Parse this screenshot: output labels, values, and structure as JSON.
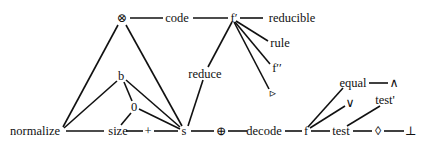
{
  "diagram": {
    "type": "graph",
    "nodes": [
      {
        "id": "otimes",
        "label": "⊗",
        "x": 122,
        "y": 18
      },
      {
        "id": "code",
        "label": "code",
        "x": 177,
        "y": 18
      },
      {
        "id": "fprime",
        "label": "f′",
        "x": 234,
        "y": 18
      },
      {
        "id": "reducible",
        "label": "reducible",
        "x": 292,
        "y": 18
      },
      {
        "id": "rule",
        "label": "rule",
        "x": 280,
        "y": 43
      },
      {
        "id": "fdouble",
        "label": "f′′",
        "x": 277,
        "y": 68
      },
      {
        "id": "triangle",
        "label": "▹",
        "x": 273,
        "y": 93
      },
      {
        "id": "reduce",
        "label": "reduce",
        "x": 205,
        "y": 74
      },
      {
        "id": "b",
        "label": "b",
        "x": 121,
        "y": 76
      },
      {
        "id": "zero",
        "label": "0",
        "x": 134,
        "y": 107
      },
      {
        "id": "normalize",
        "label": "normalize",
        "x": 35,
        "y": 131
      },
      {
        "id": "size",
        "label": "size",
        "x": 118,
        "y": 131
      },
      {
        "id": "plus",
        "label": "+",
        "x": 148,
        "y": 131
      },
      {
        "id": "s",
        "label": "s",
        "x": 184,
        "y": 131
      },
      {
        "id": "oplus",
        "label": "⊕",
        "x": 221,
        "y": 131
      },
      {
        "id": "decode",
        "label": "decode",
        "x": 264,
        "y": 131
      },
      {
        "id": "f",
        "label": "f",
        "x": 306,
        "y": 131
      },
      {
        "id": "test",
        "label": "test",
        "x": 341,
        "y": 131
      },
      {
        "id": "diamond",
        "label": "◊",
        "x": 378,
        "y": 131
      },
      {
        "id": "bottom",
        "label": "⊥",
        "x": 411,
        "y": 131
      },
      {
        "id": "equal",
        "label": "equal",
        "x": 353,
        "y": 83
      },
      {
        "id": "wedge",
        "label": "∧",
        "x": 394,
        "y": 83
      },
      {
        "id": "vee",
        "label": "∨",
        "x": 350,
        "y": 103
      },
      {
        "id": "testprime",
        "label": "test'",
        "x": 385,
        "y": 100
      }
    ],
    "edges": [
      {
        "from": "otimes",
        "to": "code",
        "pts": [
          [
            130,
            18
          ],
          [
            163,
            18
          ]
        ]
      },
      {
        "from": "code",
        "to": "fprime",
        "pts": [
          [
            193,
            18
          ],
          [
            228,
            18
          ]
        ]
      },
      {
        "from": "fprime",
        "to": "reducible",
        "pts": [
          [
            240,
            18
          ],
          [
            263,
            18
          ]
        ]
      },
      {
        "from": "fprime",
        "to": "rule",
        "pts": [
          [
            236,
            21
          ],
          [
            268,
            41
          ]
        ]
      },
      {
        "from": "fprime",
        "to": "fdouble",
        "pts": [
          [
            235,
            22
          ],
          [
            270,
            64
          ]
        ]
      },
      {
        "from": "fprime",
        "to": "triangle",
        "pts": [
          [
            234,
            22
          ],
          [
            269,
            89
          ]
        ]
      },
      {
        "from": "fprime",
        "to": "reduce",
        "pts": [
          [
            232,
            22
          ],
          [
            208,
            67
          ]
        ]
      },
      {
        "from": "reduce",
        "to": "s",
        "pts": [
          [
            203,
            80
          ],
          [
            188,
            126
          ]
        ]
      },
      {
        "from": "otimes",
        "to": "normalize",
        "pts": [
          [
            118,
            25
          ],
          [
            63,
            127
          ]
        ]
      },
      {
        "from": "otimes",
        "to": "s",
        "pts": [
          [
            126,
            25
          ],
          [
            182,
            126
          ]
        ]
      },
      {
        "from": "b",
        "to": "normalize",
        "pts": [
          [
            117,
            81
          ],
          [
            64,
            128
          ]
        ]
      },
      {
        "from": "b",
        "to": "zero",
        "pts": [
          [
            124,
            82
          ],
          [
            132,
            101
          ]
        ]
      },
      {
        "from": "b",
        "to": "s",
        "pts": [
          [
            126,
            80
          ],
          [
            180,
            127
          ]
        ]
      },
      {
        "from": "zero",
        "to": "size",
        "pts": [
          [
            131,
            113
          ],
          [
            121,
            125
          ]
        ]
      },
      {
        "from": "zero",
        "to": "s",
        "pts": [
          [
            139,
            109
          ],
          [
            180,
            129
          ]
        ]
      },
      {
        "from": "normalize",
        "to": "size",
        "pts": [
          [
            66,
            131
          ],
          [
            104,
            131
          ]
        ]
      },
      {
        "from": "size",
        "to": "plus",
        "pts": [
          [
            126,
            131
          ],
          [
            143,
            131
          ]
        ]
      },
      {
        "from": "plus",
        "to": "s",
        "pts": [
          [
            154,
            131
          ],
          [
            178,
            131
          ]
        ]
      },
      {
        "from": "s",
        "to": "oplus",
        "pts": [
          [
            191,
            131
          ],
          [
            214,
            131
          ]
        ]
      },
      {
        "from": "oplus",
        "to": "decode",
        "pts": [
          [
            228,
            131
          ],
          [
            247,
            131
          ]
        ]
      },
      {
        "from": "decode",
        "to": "f",
        "pts": [
          [
            285,
            131
          ],
          [
            302,
            131
          ]
        ]
      },
      {
        "from": "f",
        "to": "test",
        "pts": [
          [
            311,
            131
          ],
          [
            330,
            131
          ]
        ]
      },
      {
        "from": "test",
        "to": "diamond",
        "pts": [
          [
            353,
            131
          ],
          [
            372,
            131
          ]
        ]
      },
      {
        "from": "diamond",
        "to": "bottom",
        "pts": [
          [
            384,
            131
          ],
          [
            404,
            131
          ]
        ]
      },
      {
        "from": "f",
        "to": "equal",
        "pts": [
          [
            308,
            127
          ],
          [
            343,
            88
          ]
        ]
      },
      {
        "from": "f",
        "to": "vee",
        "pts": [
          [
            310,
            128
          ],
          [
            345,
            106
          ]
        ]
      },
      {
        "from": "test",
        "to": "testprime",
        "pts": [
          [
            347,
            126
          ],
          [
            380,
            106
          ]
        ]
      },
      {
        "from": "equal",
        "to": "wedge",
        "pts": [
          [
            369,
            83
          ],
          [
            388,
            83
          ]
        ]
      }
    ]
  }
}
